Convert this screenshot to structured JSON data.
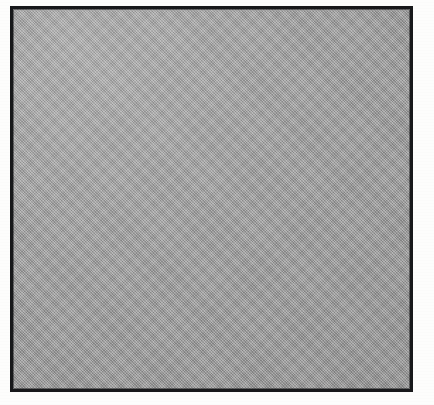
{
  "figure": {
    "kind": "blank-framed-gray-plate",
    "caption": "",
    "has_text": false,
    "has_axes": false,
    "has_legend": false
  },
  "frame": {
    "stroke_color": "#17181a",
    "stroke_width_px": 3,
    "left_px": 10,
    "top_px": 6,
    "width_px": 403,
    "height_px": 386
  },
  "plate": {
    "fill_color": "#9b9b9b",
    "texture": "dither-halftone",
    "vignette": "lighter-upper-left"
  },
  "page": {
    "background_color": "#fdfdfc",
    "width_px": 434,
    "height_px": 405
  }
}
